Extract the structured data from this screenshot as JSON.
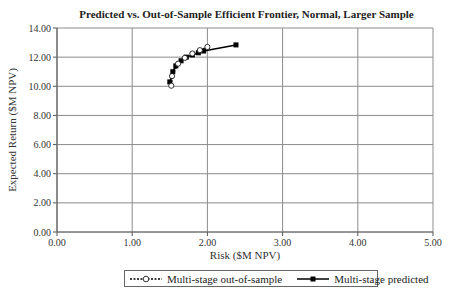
{
  "chart_data": {
    "type": "line",
    "title": "Predicted vs. Out-of-Sample Efficient Frontier, Normal, Larger Sample",
    "xlabel": "Risk ($M NPV)",
    "ylabel": "Expected Return ($M NPV)",
    "xlim": [
      0,
      5
    ],
    "ylim": [
      0,
      14
    ],
    "x_ticks": [
      "0.00",
      "1.00",
      "2.00",
      "3.00",
      "4.00",
      "5.00"
    ],
    "y_ticks": [
      "0.00",
      "2.00",
      "4.00",
      "6.00",
      "8.00",
      "10.00",
      "12.00",
      "14.00"
    ],
    "grid": true,
    "legend_position": "bottom",
    "series": [
      {
        "name": "Multi-stage out-of-sample",
        "style": "dashed, open circle markers",
        "x": [
          1.52,
          1.53,
          1.61,
          1.7,
          1.8,
          1.9,
          2.0
        ],
        "y": [
          10.04,
          10.7,
          11.55,
          11.95,
          12.25,
          12.48,
          12.7
        ]
      },
      {
        "name": "Multi-stage predicted",
        "style": "solid, filled square markers",
        "x": [
          1.5,
          1.54,
          1.58,
          1.65,
          1.72,
          1.8,
          1.88,
          1.95,
          2.38
        ],
        "y": [
          10.3,
          11.0,
          11.4,
          11.75,
          12.0,
          12.15,
          12.3,
          12.42,
          12.84
        ]
      }
    ]
  },
  "legend": {
    "item_1": "Multi-stage out-of-sample",
    "item_2": "Multi-stage predicted"
  }
}
